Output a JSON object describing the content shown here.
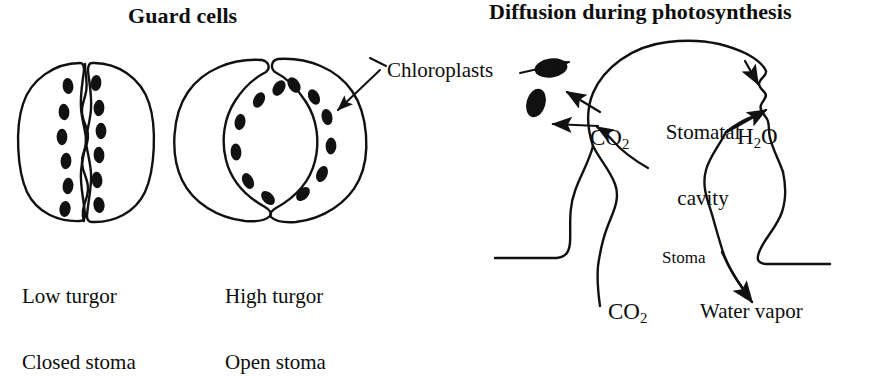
{
  "figure": {
    "background_color": "#ffffff",
    "ink_color": "#111111",
    "width": 877,
    "height": 329
  },
  "panels": {
    "left": {
      "title": "Guard cells",
      "closed": {
        "caption_line1": "Low turgor",
        "caption_line2": "Closed stoma"
      },
      "open": {
        "caption_line1": "High turgor",
        "caption_line2": "Open stoma"
      }
    },
    "right": {
      "title": "Diffusion during photosynthesis",
      "labels": {
        "stomatal_cavity_line1": "Stomatal",
        "stomatal_cavity_line2": "cavity",
        "stoma": "Stoma"
      }
    }
  },
  "annotations": {
    "chloroplasts": "Chloroplasts",
    "co2_cavity": "CO",
    "co2_cavity_sub": "2",
    "h2o": "H",
    "h2o_sub": "2",
    "h2o_tail": "O",
    "co2_bottom": "CO",
    "co2_bottom_sub": "2",
    "water_vapor": "Water vapor"
  },
  "icons": {
    "chloroplast": "chloroplast-oval-icon",
    "arrow": "diffusion-arrow-icon",
    "leader": "leader-line-icon"
  }
}
